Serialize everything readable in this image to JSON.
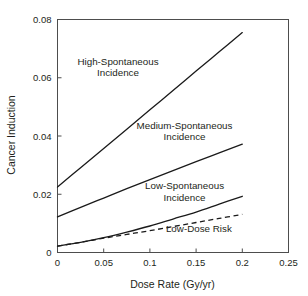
{
  "chart_data": {
    "type": "line",
    "title": "",
    "xlabel": "Dose Rate (Gy/yr)",
    "ylabel": "Cancer Induction",
    "xlim": [
      0,
      0.25
    ],
    "ylim": [
      0,
      0.08
    ],
    "xticks": [
      "0",
      "0.05",
      "0.1",
      "0.15",
      "0.2",
      "0.25"
    ],
    "xtick_values": [
      0,
      0.05,
      0.1,
      0.15,
      0.2,
      0.25
    ],
    "yticks": [
      "0",
      "0.02",
      "0.04",
      "0.06",
      "0.08"
    ],
    "ytick_values": [
      0,
      0.02,
      0.04,
      0.06,
      0.08
    ],
    "grid": false,
    "legend": "annotations-inline",
    "x": [
      0,
      0.025,
      0.05,
      0.075,
      0.1,
      0.125,
      0.15,
      0.175,
      0.2
    ],
    "series": [
      {
        "name": "High-Spontaneous Incidence",
        "style": "solid",
        "color": "#1a1a1a",
        "values": [
          0.0225,
          0.0291,
          0.0357,
          0.0423,
          0.049,
          0.0556,
          0.0623,
          0.0689,
          0.0755
        ]
      },
      {
        "name": "Medium-Spontaneous Incidence",
        "style": "solid",
        "color": "#1a1a1a",
        "values": [
          0.0122,
          0.0155,
          0.0187,
          0.0219,
          0.025,
          0.0281,
          0.0312,
          0.0342,
          0.0372
        ]
      },
      {
        "name": "Low-Spontaneous Incidence",
        "style": "solid",
        "color": "#1a1a1a",
        "values": [
          0.0022,
          0.0035,
          0.0051,
          0.007,
          0.0091,
          0.0115,
          0.0139,
          0.0166,
          0.0193
        ]
      },
      {
        "name": "Low-Dose Risk",
        "style": "dashed",
        "color": "#1a1a1a",
        "values": [
          0.0022,
          0.0035,
          0.0049,
          0.0062,
          0.0075,
          0.0089,
          0.0103,
          0.0117,
          0.0131
        ]
      }
    ],
    "annotations": [
      {
        "id": "high",
        "lines": [
          "High-Spontaneous",
          "Incidence"
        ],
        "x": 0.0655,
        "y": 0.0645
      },
      {
        "id": "medium",
        "lines": [
          "Medium-Spontaneous",
          "Incidence"
        ],
        "x": 0.1375,
        "y": 0.0425
      },
      {
        "id": "low",
        "lines": [
          "Low-Spontaneous",
          "Incidence"
        ],
        "x": 0.1375,
        "y": 0.0218
      },
      {
        "id": "lowdose",
        "lines": [
          "Low-Dose Risk"
        ],
        "x": 0.153,
        "y": 0.0072
      }
    ]
  }
}
